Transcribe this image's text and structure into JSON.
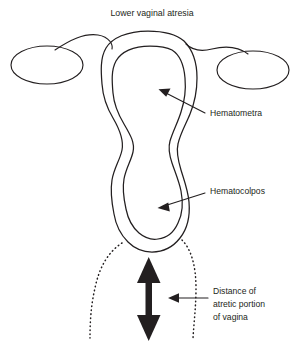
{
  "figure": {
    "title": "Lower vaginal atresia",
    "width": 298,
    "height": 346,
    "background_color": "#ffffff",
    "line_color": "#231f20"
  },
  "labels": {
    "hematometra": "Hematometra",
    "hematocolpos": "Hematocolpos",
    "distance_line_1": "Distance of",
    "distance_line_2": "atretic portion",
    "distance_line_3": "of vagina"
  },
  "structures": {
    "left_ovary": "left-ovary",
    "right_ovary": "right-ovary",
    "left_fallopian_tube": "left-fallopian-tube",
    "right_fallopian_tube": "right-fallopian-tube",
    "uterus_outer_wall": "uterus-outer-wall",
    "uterus_inner_cavity": "uterus-inner-cavity",
    "left_atretic_dotted": "left-atretic-vagina-outline",
    "right_atretic_dotted": "right-atretic-vagina-outline",
    "measurement_arrow": "vertical-double-headed-measure-arrow"
  }
}
